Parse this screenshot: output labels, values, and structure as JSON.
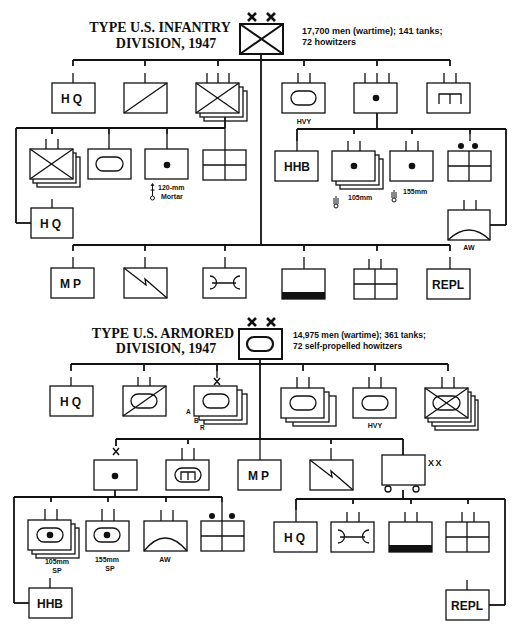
{
  "colors": {
    "ink": "#111111",
    "paper": "#ffffff"
  },
  "infantry": {
    "title_line1": "TYPE U.S. INFANTRY",
    "title_line2": "DIVISION, 1947",
    "stats_line1": "17,700 men (wartime); 141 tanks;",
    "stats_line2": "72 howitzers",
    "top_row": [
      {
        "id": "hq",
        "type": "text",
        "text": "HQ"
      },
      {
        "id": "recon",
        "type": "diag"
      },
      {
        "id": "inf-regts",
        "type": "infantry-stack"
      },
      {
        "id": "tank-bn-hvy",
        "type": "armor",
        "caption": "HVY"
      },
      {
        "id": "div-arty",
        "type": "artillery"
      },
      {
        "id": "engineer",
        "type": "engineer"
      }
    ],
    "regiment_row": [
      {
        "id": "inf-bns",
        "type": "infantry-stack"
      },
      {
        "id": "tank-co",
        "type": "armor"
      },
      {
        "id": "mortar-co",
        "type": "artillery",
        "caption1": "120-mm",
        "caption2": "Mortar"
      },
      {
        "id": "svc-co",
        "type": "quad"
      },
      {
        "id": "regt-hq",
        "type": "text",
        "text": "HQ"
      }
    ],
    "artillery_row": [
      {
        "id": "hhb",
        "type": "text",
        "text": "HHB"
      },
      {
        "id": "105-bns",
        "type": "artillery-stack",
        "caption": "105mm"
      },
      {
        "id": "155-bn",
        "type": "artillery",
        "caption": "155mm"
      },
      {
        "id": "arty-svc",
        "type": "quad-dots"
      },
      {
        "id": "aaa-bn",
        "type": "aw",
        "caption": "AW"
      }
    ],
    "bottom_row": [
      {
        "id": "mp",
        "type": "text",
        "text": "MP"
      },
      {
        "id": "signal",
        "type": "signal"
      },
      {
        "id": "ordnance",
        "type": "ordnance"
      },
      {
        "id": "medical",
        "type": "medical"
      },
      {
        "id": "quartermaster",
        "type": "quad"
      },
      {
        "id": "repl",
        "type": "text",
        "text": "REPL"
      }
    ]
  },
  "armored": {
    "title_line1": "TYPE U.S. ARMORED",
    "title_line2": "DIVISION, 1947",
    "stats_line1": "14,975 men (wartime); 361 tanks;",
    "stats_line2": "72 self-propelled howitzers",
    "top_row": [
      {
        "id": "hq",
        "type": "text",
        "text": "HQ"
      },
      {
        "id": "recon",
        "type": "armored-cav"
      },
      {
        "id": "combat-commands",
        "type": "armor-stack",
        "letters": [
          "A",
          "B",
          "R"
        ]
      },
      {
        "id": "tank-bns",
        "type": "armor-stack"
      },
      {
        "id": "tank-bn-hvy",
        "type": "armor",
        "caption": "HVY"
      },
      {
        "id": "armd-inf-bns",
        "type": "armd-inf-stack"
      }
    ],
    "middle_row": [
      {
        "id": "div-arty",
        "type": "artillery"
      },
      {
        "id": "engineer",
        "type": "armd-engineer"
      },
      {
        "id": "mp",
        "type": "text",
        "text": "MP"
      },
      {
        "id": "signal",
        "type": "signal"
      },
      {
        "id": "trains",
        "type": "trains",
        "echelon": "XX"
      }
    ],
    "arty_row": [
      {
        "id": "105-sp",
        "type": "sp-stack",
        "caption1": "105mm",
        "caption2": "SP"
      },
      {
        "id": "155-sp",
        "type": "sp",
        "caption1": "155mm",
        "caption2": "SP"
      },
      {
        "id": "aw",
        "type": "aw",
        "caption": "AW"
      },
      {
        "id": "arty-svc",
        "type": "quad-dots"
      },
      {
        "id": "hhb",
        "type": "text",
        "text": "HHB"
      }
    ],
    "trains_row": [
      {
        "id": "hq",
        "type": "text",
        "text": "HQ"
      },
      {
        "id": "ordnance",
        "type": "ordnance"
      },
      {
        "id": "medical",
        "type": "medical"
      },
      {
        "id": "quartermaster",
        "type": "quad"
      },
      {
        "id": "repl",
        "type": "text",
        "text": "REPL"
      }
    ]
  }
}
